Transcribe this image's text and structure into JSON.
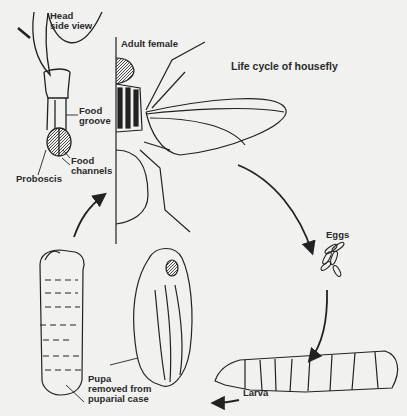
{
  "title": "Life cycle of housefly",
  "labels": {
    "head_side_view_1": "Head",
    "head_side_view_2": "side view",
    "adult_female": "Adult female",
    "food_groove_1": "Food",
    "food_groove_2": "groove",
    "food_channels_1": "Food",
    "food_channels_2": "channels",
    "proboscis": "Proboscis",
    "eggs": "Eggs",
    "larva": "Larva",
    "pupa_1": "Pupa",
    "pupa_2": "removed from",
    "pupa_3": "puparial case"
  },
  "stages": [
    "Adult female",
    "Eggs",
    "Larva",
    "Pupa"
  ],
  "colors": {
    "background": "#f1f1ef",
    "ink": "#2a2a2a"
  }
}
